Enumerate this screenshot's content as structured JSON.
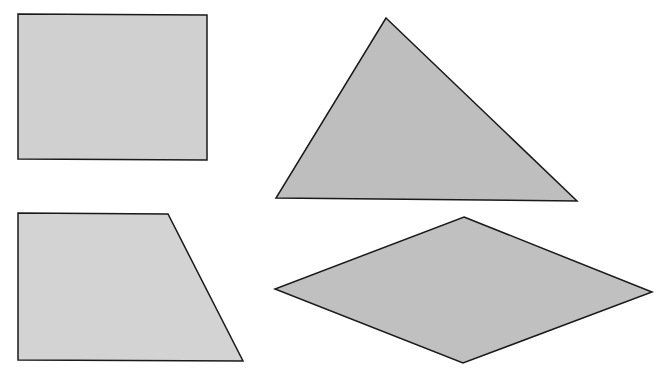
{
  "canvas": {
    "width": 665,
    "height": 376,
    "background": "#ffffff"
  },
  "stroke": {
    "color": "#1a1a1a",
    "width": 1.5
  },
  "shapes": [
    {
      "name": "rectangle",
      "points": "18,14 207,15 207,160 18,159",
      "fill": "#d0d0d0"
    },
    {
      "name": "triangle",
      "points": "386,18 577,201 276,198",
      "fill": "#bebebe"
    },
    {
      "name": "trapezoid",
      "points": "18,213 168,214 243,361 18,360",
      "fill": "#d3d3d3"
    },
    {
      "name": "rhombus",
      "points": "464,217 652,292 463,363 275,289",
      "fill": "#c0c0c0"
    }
  ]
}
